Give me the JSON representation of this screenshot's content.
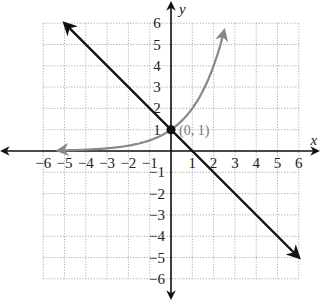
{
  "chart_data": {
    "type": "line",
    "title": "",
    "xlabel": "x",
    "ylabel": "y",
    "xlim": [
      -6,
      6
    ],
    "ylim": [
      -6,
      6
    ],
    "grid": true,
    "grid_style": "dotted",
    "x_ticks": [
      -6,
      -5,
      -4,
      -3,
      -2,
      -1,
      1,
      2,
      3,
      4,
      5,
      6
    ],
    "y_ticks": [
      -6,
      -5,
      -4,
      -3,
      -2,
      -1,
      1,
      2,
      3,
      4,
      5,
      6
    ],
    "x_tick_labels": [
      "−6",
      "−5",
      "−4",
      "−3",
      "−2",
      "−1",
      "1",
      "2",
      "3",
      "4",
      "5",
      "6"
    ],
    "y_tick_labels": [
      "−6",
      "−5",
      "−4",
      "−3",
      "−2",
      "−1",
      "1",
      "2",
      "3",
      "4",
      "5",
      "6"
    ],
    "series": [
      {
        "name": "y = 2^x",
        "kind": "exponential curve",
        "color": "#888888",
        "x": [
          -5.3,
          -4,
          -3,
          -2,
          -1,
          0,
          1,
          2,
          2.5
        ],
        "y": [
          0.03,
          0.06,
          0.13,
          0.25,
          0.5,
          1,
          2,
          4,
          5.66
        ],
        "arrow_start": true,
        "arrow_end": true
      },
      {
        "name": "y = -x + 1",
        "kind": "line",
        "color": "#111111",
        "x": [
          -5,
          6
        ],
        "y": [
          6,
          -5
        ],
        "arrow_start": true,
        "arrow_end": true
      }
    ],
    "annotations": [
      {
        "text": "(0, 1)",
        "x": 0,
        "y": 1,
        "marker": "filled-dot"
      }
    ]
  },
  "labels": {
    "x_axis": "x",
    "y_axis": "y",
    "point": "(0, 1)"
  }
}
